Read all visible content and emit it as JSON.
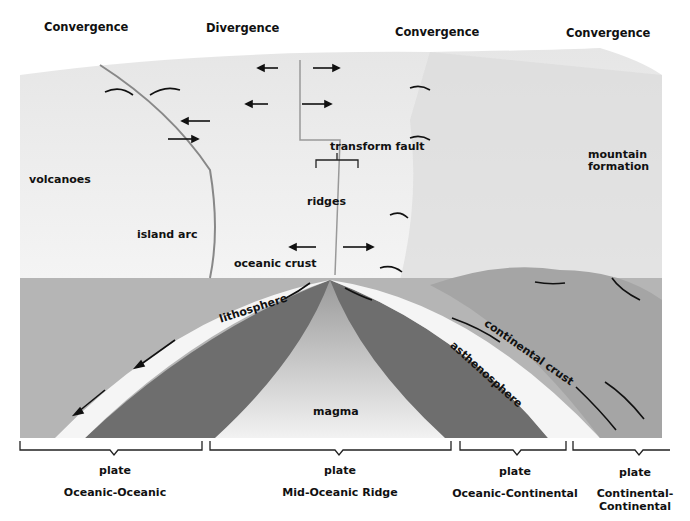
{
  "headers": [
    "Convergence",
    "Divergence",
    "Convergence",
    "Convergence"
  ],
  "labels": {
    "transform_fault": "transform fault",
    "mountain_formation_1": "mountain",
    "mountain_formation_2": "formation",
    "volcanoes": "volcanoes",
    "ridges": "ridges",
    "island_arc": "island arc",
    "oceanic_crust": "oceanic crust",
    "lithosphere": "lithosphere",
    "continental_crust": "continental crust",
    "asthenosphere": "asthenosphere",
    "magma": "magma"
  },
  "plates": [
    {
      "plate": "plate",
      "type": "Oceanic-Oceanic"
    },
    {
      "plate": "plate",
      "type": "Mid-Oceanic Ridge"
    },
    {
      "plate": "plate",
      "type": "Oceanic-Continental"
    },
    {
      "plate": "plate",
      "type": "Continental-",
      "type2": "Continental"
    }
  ]
}
